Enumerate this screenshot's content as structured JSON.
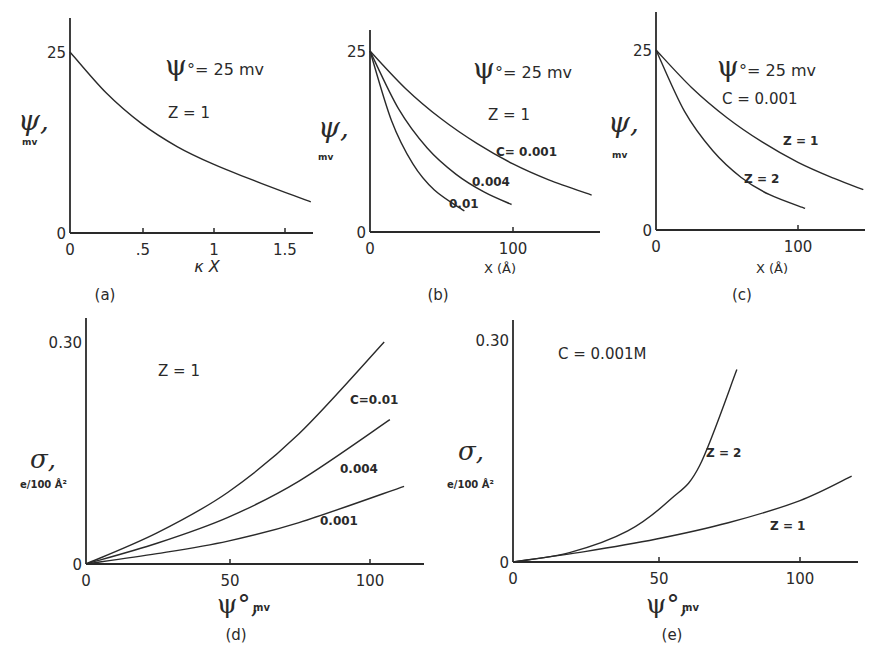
{
  "figure": {
    "panels": [
      "(a)",
      "(b)",
      "(c)",
      "(d)",
      "(e)"
    ]
  },
  "chart_data": [
    {
      "id": "a",
      "type": "line",
      "caption": "(a)",
      "xlabel": "κ X",
      "ylabel": "ψ,",
      "ylabel_unit": "mv",
      "xticks": [
        "0",
        ".5",
        "1",
        "1.5"
      ],
      "yticks": [
        "0",
        "25"
      ],
      "xlim": [
        0,
        1.68
      ],
      "ylim": [
        0,
        25
      ],
      "annotations": [
        "ψ°= 25 mv",
        "Z = 1"
      ],
      "grid": false,
      "series": [
        {
          "name": "Z=1, ψ°=25 mv",
          "x": [
            0,
            0.25,
            0.5,
            0.75,
            1.0,
            1.25,
            1.5,
            1.68
          ],
          "y": [
            25,
            19.4,
            15.1,
            11.9,
            9.5,
            7.5,
            5.6,
            4.3
          ]
        }
      ]
    },
    {
      "id": "b",
      "type": "line",
      "caption": "(b)",
      "xlabel": "X (Å)",
      "ylabel": "ψ,",
      "ylabel_unit": "mv",
      "xticks": [
        "0",
        "100"
      ],
      "yticks": [
        "0",
        "25"
      ],
      "xlim": [
        0,
        160
      ],
      "ylim": [
        0,
        25
      ],
      "annotations": [
        "ψ°= 25 mv",
        "Z = 1"
      ],
      "grid": false,
      "series": [
        {
          "name": "C= 0.001",
          "x": [
            0,
            25,
            50,
            75,
            100,
            125,
            155
          ],
          "y": [
            25,
            19.8,
            15.6,
            12.2,
            9.4,
            7.2,
            5.1
          ]
        },
        {
          "name": "0.004",
          "x": [
            0,
            20,
            40,
            60,
            80,
            99
          ],
          "y": [
            25,
            17.0,
            11.6,
            8.0,
            5.5,
            3.8
          ]
        },
        {
          "name": "0.01",
          "x": [
            0,
            15,
            30,
            45,
            66
          ],
          "y": [
            25,
            15.4,
            9.4,
            5.8,
            2.9
          ]
        }
      ]
    },
    {
      "id": "c",
      "type": "line",
      "caption": "(c)",
      "xlabel": "X (Å)",
      "ylabel": "ψ,",
      "ylabel_unit": "mv",
      "xticks": [
        "0",
        "100"
      ],
      "yticks": [
        "0",
        "25"
      ],
      "xlim": [
        0,
        150
      ],
      "ylim": [
        0,
        25
      ],
      "annotations": [
        "ψ°= 25 mv",
        "C = 0.001"
      ],
      "grid": false,
      "series": [
        {
          "name": "Z = 1",
          "x": [
            0,
            25,
            50,
            75,
            100,
            125,
            146
          ],
          "y": [
            25,
            19.8,
            15.6,
            12.2,
            9.4,
            7.2,
            5.6
          ]
        },
        {
          "name": "Z = 2",
          "x": [
            0,
            20,
            40,
            60,
            80,
            105
          ],
          "y": [
            25,
            16.5,
            11.0,
            7.3,
            4.9,
            3.0
          ]
        }
      ]
    },
    {
      "id": "d",
      "type": "line",
      "caption": "(d)",
      "xlabel": "ψ°, mv",
      "ylabel": "σ,",
      "ylabel_unit": "e/100 Å²",
      "xticks": [
        "0",
        "50",
        "100"
      ],
      "yticks": [
        "0",
        "0.30"
      ],
      "xlim": [
        0,
        120
      ],
      "ylim": [
        0,
        0.3
      ],
      "annotations": [
        "Z = 1"
      ],
      "grid": false,
      "series": [
        {
          "name": "C=0.01",
          "x": [
            0,
            25,
            50,
            75,
            105
          ],
          "y": [
            0,
            0.042,
            0.097,
            0.176,
            0.3
          ]
        },
        {
          "name": "0.004",
          "x": [
            0,
            25,
            50,
            75,
            107
          ],
          "y": [
            0,
            0.028,
            0.063,
            0.112,
            0.195
          ]
        },
        {
          "name": "0.001",
          "x": [
            0,
            25,
            50,
            75,
            112
          ],
          "y": [
            0,
            0.014,
            0.031,
            0.056,
            0.105
          ]
        }
      ]
    },
    {
      "id": "e",
      "type": "line",
      "caption": "(e)",
      "xlabel": "ψ°, mv",
      "ylabel": "σ,",
      "ylabel_unit": "e/100 Å²",
      "xticks": [
        "0",
        "50",
        "100"
      ],
      "yticks": [
        "0",
        "0.30"
      ],
      "xlim": [
        0,
        122
      ],
      "ylim": [
        0,
        0.3
      ],
      "annotations": [
        "C = 0.001M"
      ],
      "grid": false,
      "series": [
        {
          "name": "Z = 2",
          "x": [
            0,
            20,
            40,
            55,
            65,
            78
          ],
          "y": [
            0,
            0.013,
            0.042,
            0.085,
            0.13,
            0.26
          ]
        },
        {
          "name": "Z = 1",
          "x": [
            0,
            25,
            50,
            75,
            100,
            118
          ],
          "y": [
            0,
            0.014,
            0.031,
            0.053,
            0.083,
            0.116
          ]
        }
      ]
    }
  ]
}
